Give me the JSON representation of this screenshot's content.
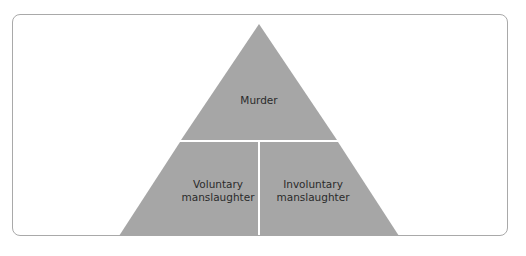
{
  "diagram": {
    "type": "pyramid",
    "colors": {
      "fill": "#a6a6a6",
      "divider": "#ffffff",
      "frame_border": "#a9a9a9",
      "text": "#2b2b2b"
    },
    "levels": [
      {
        "id": "top",
        "label": "Murder"
      },
      {
        "id": "bottom-left",
        "label_line1": "Voluntary",
        "label_line2": "manslaughter"
      },
      {
        "id": "bottom-right",
        "label_line1": "Involuntary",
        "label_line2": "manslaughter"
      }
    ]
  }
}
